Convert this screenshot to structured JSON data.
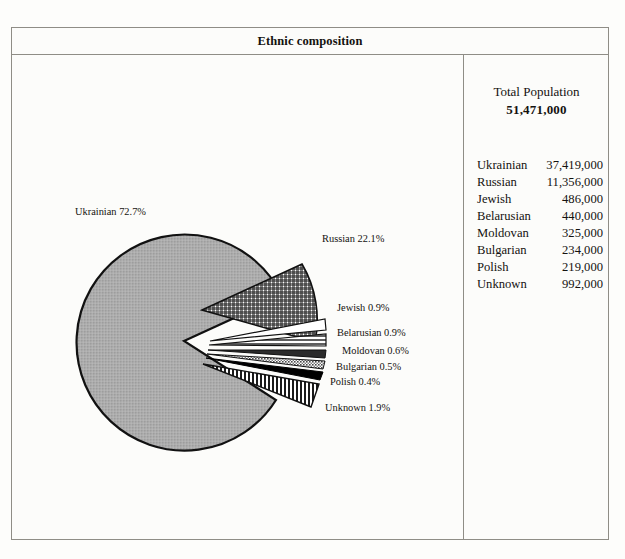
{
  "title": "Ethnic composition",
  "stats": {
    "population_label": "Total Population",
    "population_value": "51,471,000"
  },
  "table": {
    "rows": [
      {
        "label": "Ukrainian",
        "value": "37,419,000"
      },
      {
        "label": "Russian",
        "value": "11,356,000"
      },
      {
        "label": "Jewish",
        "value": "486,000"
      },
      {
        "label": "Belarusian",
        "value": "440,000"
      },
      {
        "label": "Moldovan",
        "value": "325,000"
      },
      {
        "label": "Bulgarian",
        "value": "234,000"
      },
      {
        "label": "Polish",
        "value": "219,000"
      },
      {
        "label": "Unknown",
        "value": "992,000"
      }
    ]
  },
  "pie_labels": [
    {
      "text": "Ukrainian 72.7%",
      "x": 63,
      "y": 160,
      "anchor": "start"
    },
    {
      "text": "Russian 22.1%",
      "x": 310,
      "y": 187,
      "anchor": "start"
    },
    {
      "text": "Jewish 0.9%",
      "x": 325,
      "y": 256,
      "anchor": "start"
    },
    {
      "text": "Belarusian 0.9%",
      "x": 325,
      "y": 281,
      "anchor": "start"
    },
    {
      "text": "Moldovan 0.6%",
      "x": 330,
      "y": 299,
      "anchor": "start"
    },
    {
      "text": "Bulgarian 0.5%",
      "x": 324,
      "y": 315,
      "anchor": "start"
    },
    {
      "text": "Polish 0.4%",
      "x": 318,
      "y": 330,
      "anchor": "start"
    },
    {
      "text": "Unknown 1.9%",
      "x": 313,
      "y": 356,
      "anchor": "start"
    }
  ],
  "chart_data": {
    "type": "pie",
    "title": "Ethnic composition",
    "categories": [
      "Ukrainian",
      "Russian",
      "Jewish",
      "Belarusian",
      "Moldovan",
      "Bulgarian",
      "Polish",
      "Unknown"
    ],
    "values": [
      37419000,
      11356000,
      486000,
      440000,
      325000,
      234000,
      219000,
      992000
    ],
    "percentages": [
      72.7,
      22.1,
      0.9,
      0.9,
      0.6,
      0.5,
      0.4,
      1.9
    ],
    "value_labels": [
      "37,419,000",
      "11,356,000",
      "486,000",
      "440,000",
      "325,000",
      "234,000",
      "219,000",
      "992,000"
    ],
    "percent_labels": [
      "72.7%",
      "22.1%",
      "0.9%",
      "0.9%",
      "0.6%",
      "0.5%",
      "0.4%",
      "1.9%"
    ],
    "total": 51471000,
    "total_label": "51,471,000",
    "exploded": [
      "Russian",
      "Jewish",
      "Belarusian",
      "Moldovan",
      "Bulgarian",
      "Polish",
      "Unknown"
    ],
    "fills": [
      "solid-gray",
      "cross-hatch",
      "white",
      "horizontal-lines",
      "dark-solid",
      "stipple-gray",
      "black",
      "vertical-stripes"
    ],
    "legend_position": "right-table",
    "grid": false,
    "xlabel": "",
    "ylabel": ""
  },
  "colors": {
    "ink": "#14120f",
    "rule": "#8f8d86",
    "paper": "#fcfcfa",
    "ukrainian_gray": "#a9a9a9",
    "bulgarian_gray": "#9a9a9a"
  }
}
